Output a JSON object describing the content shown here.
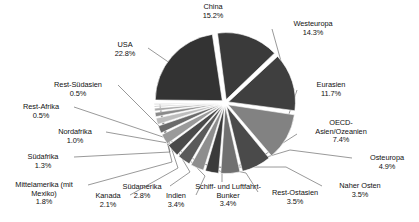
{
  "chart_data": {
    "type": "pie",
    "title": "",
    "subtitle": "",
    "xlabel": "",
    "ylabel": "",
    "legend_position": "labels-outside",
    "grid": false,
    "exploded": true,
    "units": "%",
    "start_angle_deg": -8,
    "categories": [
      "China",
      "Westeuropa",
      "Eurasien",
      "OECD-Asien/Ozeanien",
      "Osteuropa",
      "Naher Osten",
      "Rest-Ostasien",
      "Schiff- und Luftfahrt-Bunker",
      "Indien",
      "Südamerika",
      "Kanada",
      "Mittelamerika (mit Mexiko)",
      "Südafrika",
      "Nordafrika",
      "Rest-Afrika",
      "Rest-Südasien",
      "USA"
    ],
    "values": [
      15.2,
      14.3,
      11.7,
      7.4,
      4.9,
      3.5,
      3.5,
      3.4,
      3.4,
      2.8,
      2.1,
      1.8,
      1.3,
      1.0,
      0.5,
      0.5,
      22.8
    ],
    "value_labels": [
      "15.2%",
      "14.3%",
      "11.7%",
      "7.4%",
      "4.9%",
      "3.5%",
      "3.5%",
      "3.4%",
      "3.4%",
      "2.8%",
      "2.1%",
      "1.8%",
      "1.3%",
      "1.0%",
      "0.5%",
      "0.5%",
      "22.8%"
    ],
    "colors": [
      "#3a3a3a",
      "#3f3f3f",
      "#828282",
      "#4a4a4a",
      "#707070",
      "#3b3b3b",
      "#8e8e8e",
      "#5a5a5a",
      "#4a4a4a",
      "#9a9a9a",
      "#6a6a6a",
      "#bdbdbd",
      "#8a8a8a",
      "#a8a8a8",
      "#787878",
      "#9c9c9c",
      "#333333"
    ],
    "slices": [
      {
        "name": "China",
        "value": 15.2,
        "label": "China",
        "pct": "15.2%",
        "color": "#3a3a3a"
      },
      {
        "name": "Westeuropa",
        "value": 14.3,
        "label": "Westeuropa",
        "pct": "14.3%",
        "color": "#3f3f3f"
      },
      {
        "name": "Eurasien",
        "value": 11.7,
        "label": "Eurasien",
        "pct": "11.7%",
        "color": "#828282"
      },
      {
        "name": "OECD-Asien/Ozeanien",
        "value": 7.4,
        "label": "OECD-Asien/Ozeanien",
        "pct": "7.4%",
        "color": "#4a4a4a"
      },
      {
        "name": "Osteuropa",
        "value": 4.9,
        "label": "Osteuropa",
        "pct": "4.9%",
        "color": "#707070"
      },
      {
        "name": "Naher Osten",
        "value": 3.5,
        "label": "Naher Osten",
        "pct": "3.5%",
        "color": "#3b3b3b"
      },
      {
        "name": "Rest-Ostasien",
        "value": 3.5,
        "label": "Rest-Ostasien",
        "pct": "3.5%",
        "color": "#8e8e8e"
      },
      {
        "name": "Schiff- und Luftfahrt-Bunker",
        "value": 3.4,
        "label": "Schiff- und Luftfahrt-Bunker",
        "pct": "3.4%",
        "color": "#5a5a5a"
      },
      {
        "name": "Indien",
        "value": 3.4,
        "label": "Indien",
        "pct": "3.4%",
        "color": "#4a4a4a"
      },
      {
        "name": "Südamerika",
        "value": 2.8,
        "label": "Südamerika",
        "pct": "2.8%",
        "color": "#9a9a9a"
      },
      {
        "name": "Kanada",
        "value": 2.1,
        "label": "Kanada",
        "pct": "2.1%",
        "color": "#6a6a6a"
      },
      {
        "name": "Mittelamerika (mit Mexiko)",
        "value": 1.8,
        "label": "Mittelamerika (mit",
        "label2": "Mexiko)",
        "pct": "1.8%",
        "color": "#bdbdbd"
      },
      {
        "name": "Südafrika",
        "value": 1.3,
        "label": "Südafrika",
        "pct": "1.3%",
        "color": "#8a8a8a"
      },
      {
        "name": "Nordafrika",
        "value": 1.0,
        "label": "Nordafrika",
        "pct": "1.0%",
        "color": "#a8a8a8"
      },
      {
        "name": "Rest-Afrika",
        "value": 0.5,
        "label": "Rest-Afrika",
        "pct": "0.5%",
        "color": "#787878"
      },
      {
        "name": "Rest-Südasien",
        "value": 0.5,
        "label": "Rest-Südasien",
        "pct": "0.5%",
        "color": "#9c9c9c"
      },
      {
        "name": "USA",
        "value": 22.8,
        "label": "USA",
        "pct": "22.8%",
        "color": "#333333"
      }
    ]
  },
  "labels": {
    "china": {
      "name": "China",
      "pct": "15.2%"
    },
    "westeuropa": {
      "name": "Westeuropa",
      "pct": "14.3%"
    },
    "eurasien": {
      "name": "Eurasien",
      "pct": "11.7%"
    },
    "oecd_l1": "OECD-",
    "oecd_l2": "Asien/Ozeanien",
    "oecd_pct": "7.4%",
    "osteuropa": {
      "name": "Osteuropa",
      "pct": "4.9%"
    },
    "naher_osten": {
      "name": "Naher Osten",
      "pct": "3.5%"
    },
    "rest_ostasien": {
      "name": "Rest-Ostasien",
      "pct": "3.5%"
    },
    "bunker_l1": "Schiff- und Luftfahrt-",
    "bunker_l2": "Bunker",
    "bunker_pct": "3.4%",
    "indien": {
      "name": "Indien",
      "pct": "3.4%"
    },
    "suedamerika": {
      "name": "Südamerika",
      "pct": "2.8%"
    },
    "kanada": {
      "name": "Kanada",
      "pct": "2.1%"
    },
    "mittelamerika_l1": "Mittelamerika (mit",
    "mittelamerika_l2": "Mexiko)",
    "mittelamerika_pct": "1.8%",
    "suedafrika": {
      "name": "Südafrika",
      "pct": "1.3%"
    },
    "nordafrika": {
      "name": "Nordafrika",
      "pct": "1.0%"
    },
    "rest_afrika": {
      "name": "Rest-Afrika",
      "pct": "0.5%"
    },
    "rest_suedasien": {
      "name": "Rest-Südasien",
      "pct": "0.5%"
    },
    "usa": {
      "name": "USA",
      "pct": "22.8%"
    }
  }
}
